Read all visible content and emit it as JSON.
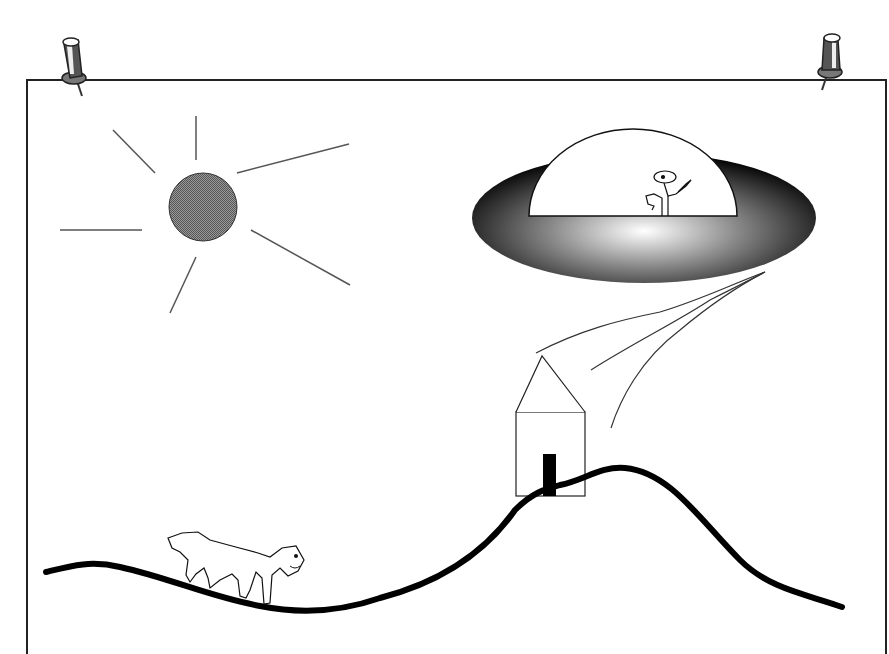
{
  "canvas": {
    "width": 889,
    "height": 654,
    "background": "#ffffff"
  },
  "paper": {
    "left": 27,
    "top": 80,
    "right": 886,
    "bottom": 654,
    "stroke": "#222222"
  },
  "pins": [
    {
      "name": "pushpin-left",
      "x": 72,
      "y": 62
    },
    {
      "name": "pushpin-right",
      "x": 830,
      "y": 58
    }
  ],
  "sun": {
    "cx": 203,
    "cy": 207,
    "r": 34,
    "fill": "#7a7a7a",
    "rays": [
      [
        196,
        116,
        196,
        160
      ],
      [
        113,
        130,
        155,
        173
      ],
      [
        60,
        230,
        142,
        230
      ],
      [
        170,
        313,
        196,
        257
      ],
      [
        237,
        173,
        349,
        144
      ],
      [
        251,
        230,
        350,
        285
      ]
    ]
  },
  "ufo": {
    "cx": 644,
    "cy": 218,
    "rx": 172,
    "ry": 65,
    "dome": {
      "cx": 633,
      "cy": 216,
      "rx": 104,
      "ry": 87
    }
  },
  "house": {
    "x": 516,
    "y": 412,
    "w": 69,
    "h": 84,
    "roof_peak_x": 542,
    "roof_peak_y": 356,
    "door": {
      "x": 543,
      "y": 454,
      "w": 13,
      "h": 42
    }
  },
  "smoke": [
    "M536,353 C580,330 620,320 660,312 C700,300 730,285 765,272",
    "M591,370 C630,345 680,320 710,300 C730,290 750,280 765,272",
    "M611,428 C620,400 640,360 680,330 C710,305 740,285 765,272"
  ],
  "hill": "M46,572 C70,566 90,560 120,567 C170,578 210,597 260,606 C300,614 340,612 380,598 C430,585 480,560 515,510 C535,490 550,488 560,485 C585,480 600,466 625,468 C670,472 700,520 740,560 C770,590 810,595 842,607",
  "dog": "M168,538 L182,533 L198,532 L210,540 L232,546 L258,553 L270,557 L282,548 L296,546 L304,560 L298,571 L288,576 L280,568 L272,575 L270,603 L264,604 L262,578 L256,572 L250,590 L246,598 L240,596 L238,580 L232,574 L220,580 L210,588 L208,578 L204,568 L196,574 L190,582 L186,575 L188,560 L180,552 L172,548 Z"
}
